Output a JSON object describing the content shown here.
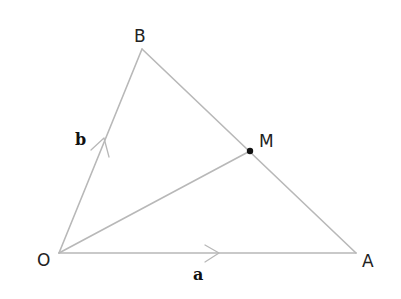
{
  "diagram": {
    "type": "geometry-vector-triangle",
    "colors": {
      "line": "#b8b8b8",
      "point": "#111111",
      "label": "#222222"
    },
    "points": {
      "O": {
        "label": "O",
        "x": 59,
        "y": 253
      },
      "A": {
        "label": "A",
        "x": 356,
        "y": 253
      },
      "B": {
        "label": "B",
        "x": 142,
        "y": 49
      },
      "M": {
        "label": "M",
        "x": 250,
        "y": 151
      }
    },
    "segments": [
      {
        "from": "O",
        "to": "A"
      },
      {
        "from": "O",
        "to": "B"
      },
      {
        "from": "B",
        "to": "A"
      },
      {
        "from": "O",
        "to": "M"
      }
    ],
    "vectors": {
      "a": {
        "label": "a",
        "on": "OA"
      },
      "b": {
        "label": "b",
        "on": "OB"
      }
    }
  }
}
